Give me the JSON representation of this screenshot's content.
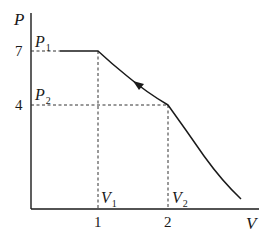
{
  "diagram": {
    "type": "pv-diagram",
    "axes": {
      "y": {
        "label": "P",
        "ticks": [
          {
            "value": "7",
            "label": "7"
          },
          {
            "value": "4",
            "label": "4"
          }
        ]
      },
      "x": {
        "label": "V",
        "ticks": [
          {
            "value": "1",
            "label": "1"
          },
          {
            "value": "2",
            "label": "2"
          }
        ]
      }
    },
    "points": {
      "P1": {
        "base": "P",
        "sub": "1"
      },
      "P2": {
        "base": "P",
        "sub": "2"
      },
      "V1": {
        "base": "V",
        "sub": "1"
      },
      "V2": {
        "base": "V",
        "sub": "2"
      }
    },
    "curve": {
      "description": "Horizontal segment at P=7 up to V=1, then curve down through (V=2, P=4), continuing down beyond; arrow on segment between V2 and V1 pointing toward V1",
      "arrow_direction": "from (2,4) toward (1,7)"
    },
    "colors": {
      "line": "#1a1a1a",
      "dashed": "#333333",
      "background": "#ffffff"
    }
  }
}
